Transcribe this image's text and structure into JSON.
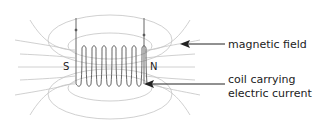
{
  "diagram": {
    "poles": {
      "south": "S",
      "north": "N"
    },
    "labels": {
      "field": "magnetic field",
      "coil_line1": "coil carrying",
      "coil_line2": "electric current"
    },
    "colors": {
      "field_lines": "#bbbbbb",
      "coil": "#555555",
      "text": "#222222"
    }
  }
}
